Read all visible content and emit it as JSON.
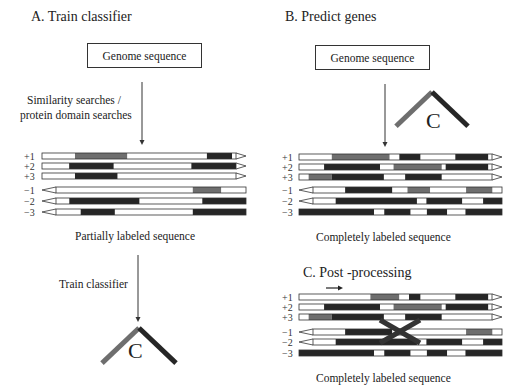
{
  "panels": {
    "a": {
      "title": "A. Train classifier",
      "input_box": "Genome sequence",
      "step_label_line1": "Similarity searches /",
      "step_label_line2": "protein domain searches",
      "caption": "Partially labeled sequence",
      "train_label": "Train classifier",
      "classifier_letter": "C"
    },
    "b": {
      "title": "B. Predict genes",
      "input_box": "Genome sequence",
      "classifier_letter": "C",
      "caption": "Completely labeled sequence"
    },
    "c": {
      "title": "C. Post -processing",
      "caption": "Completely labeled sequence"
    }
  },
  "frame_labels": [
    "+1",
    "+2",
    "+3",
    "−1",
    "−2",
    "−3"
  ],
  "colors": {
    "coding_dark": "#262626",
    "coding_gray": "#6e6e6e",
    "noncoding": "#ffffff",
    "outline": "#333333"
  },
  "tracks": {
    "a": [
      {
        "label": "+1",
        "dir": "fwd",
        "segs": [
          [
            0,
            0.17,
            "w"
          ],
          [
            0.17,
            0.44,
            "g"
          ],
          [
            0.44,
            0.85,
            "w"
          ],
          [
            0.85,
            0.98,
            "d"
          ],
          [
            0.98,
            1,
            "w"
          ]
        ]
      },
      {
        "label": "+2",
        "dir": "fwd",
        "segs": [
          [
            0,
            0.14,
            "w"
          ],
          [
            0.14,
            0.37,
            "d"
          ],
          [
            0.37,
            0.77,
            "w"
          ],
          [
            0.77,
            1,
            "d"
          ]
        ]
      },
      {
        "label": "+3",
        "dir": "fwd",
        "segs": [
          [
            0,
            0.17,
            "w"
          ],
          [
            0.17,
            0.39,
            "d"
          ],
          [
            0.39,
            1,
            "w"
          ]
        ]
      },
      {
        "label": "−1",
        "dir": "rev",
        "segs": [
          [
            0,
            0.2,
            "w"
          ],
          [
            0.2,
            0.72,
            "w"
          ],
          [
            0.72,
            0.87,
            "g"
          ],
          [
            0.87,
            1,
            "w"
          ]
        ]
      },
      {
        "label": "−2",
        "dir": "rev",
        "segs": [
          [
            0,
            0.07,
            "w"
          ],
          [
            0.07,
            0.44,
            "d"
          ],
          [
            0.44,
            0.77,
            "w"
          ],
          [
            0.77,
            1,
            "d"
          ]
        ]
      },
      {
        "label": "−3",
        "dir": "rev",
        "segs": [
          [
            0,
            0.13,
            "w"
          ],
          [
            0.13,
            0.31,
            "d"
          ],
          [
            0.31,
            0.72,
            "w"
          ],
          [
            0.72,
            1,
            "d"
          ]
        ]
      }
    ],
    "b": [
      {
        "label": "+1",
        "dir": "fwd",
        "segs": [
          [
            0,
            0.17,
            "w"
          ],
          [
            0.17,
            0.47,
            "g"
          ],
          [
            0.47,
            0.52,
            "w"
          ],
          [
            0.52,
            0.63,
            "d"
          ],
          [
            0.63,
            0.81,
            "w"
          ],
          [
            0.81,
            0.98,
            "d"
          ]
        ]
      },
      {
        "label": "+2",
        "dir": "fwd",
        "segs": [
          [
            0,
            0.13,
            "w"
          ],
          [
            0.13,
            0.42,
            "d"
          ],
          [
            0.42,
            0.49,
            "w"
          ],
          [
            0.49,
            0.74,
            "g"
          ],
          [
            0.74,
            0.76,
            "w"
          ],
          [
            0.76,
            0.98,
            "d"
          ]
        ]
      },
      {
        "label": "+3",
        "dir": "fwd",
        "segs": [
          [
            0,
            0.05,
            "w"
          ],
          [
            0.05,
            0.17,
            "g"
          ],
          [
            0.17,
            0.44,
            "d"
          ],
          [
            0.44,
            0.55,
            "w"
          ],
          [
            0.55,
            0.74,
            "d"
          ],
          [
            0.74,
            0.98,
            "w"
          ]
        ]
      },
      {
        "label": "−1",
        "dir": "rev",
        "segs": [
          [
            0,
            0.17,
            "w"
          ],
          [
            0.17,
            0.42,
            "d"
          ],
          [
            0.42,
            0.5,
            "w"
          ],
          [
            0.5,
            0.62,
            "g"
          ],
          [
            0.62,
            0.81,
            "w"
          ],
          [
            0.81,
            0.95,
            "g"
          ],
          [
            0.95,
            1,
            "w"
          ]
        ]
      },
      {
        "label": "−2",
        "dir": "rev",
        "segs": [
          [
            0,
            0.12,
            "w"
          ],
          [
            0.12,
            0.55,
            "d"
          ],
          [
            0.55,
            0.6,
            "w"
          ],
          [
            0.6,
            0.79,
            "d"
          ],
          [
            0.79,
            0.9,
            "w"
          ],
          [
            0.9,
            1,
            "d"
          ]
        ]
      },
      {
        "label": "−3",
        "dir": "none",
        "segs": [
          [
            0,
            0.37,
            "d"
          ],
          [
            0.37,
            0.42,
            "w"
          ],
          [
            0.42,
            0.55,
            "d"
          ],
          [
            0.55,
            0.63,
            "w"
          ],
          [
            0.63,
            0.73,
            "d"
          ],
          [
            0.73,
            0.82,
            "w"
          ],
          [
            0.82,
            1,
            "d"
          ]
        ]
      }
    ],
    "c": [
      {
        "label": "+1",
        "dir": "fwd",
        "segs": [
          [
            0,
            0.37,
            "w"
          ],
          [
            0.37,
            0.52,
            "g"
          ],
          [
            0.52,
            0.57,
            "w"
          ],
          [
            0.57,
            0.63,
            "d"
          ],
          [
            0.63,
            0.81,
            "w"
          ],
          [
            0.81,
            0.98,
            "d"
          ]
        ]
      },
      {
        "label": "+2",
        "dir": "fwd",
        "segs": [
          [
            0,
            0.13,
            "w"
          ],
          [
            0.13,
            0.42,
            "d"
          ],
          [
            0.42,
            0.49,
            "w"
          ],
          [
            0.49,
            0.74,
            "g"
          ],
          [
            0.74,
            0.76,
            "w"
          ],
          [
            0.76,
            0.98,
            "d"
          ]
        ]
      },
      {
        "label": "+3",
        "dir": "fwd",
        "segs": [
          [
            0,
            0.05,
            "w"
          ],
          [
            0.05,
            0.17,
            "g"
          ],
          [
            0.17,
            0.44,
            "d"
          ],
          [
            0.44,
            0.55,
            "w"
          ],
          [
            0.55,
            0.74,
            "d"
          ],
          [
            0.74,
            0.98,
            "w"
          ]
        ]
      },
      {
        "label": "−1",
        "dir": "rev",
        "segs": [
          [
            0,
            0.17,
            "w"
          ],
          [
            0.17,
            0.42,
            "d"
          ],
          [
            0.42,
            0.5,
            "w"
          ],
          [
            0.5,
            0.62,
            "w"
          ],
          [
            0.62,
            0.81,
            "w"
          ],
          [
            0.81,
            0.95,
            "g"
          ],
          [
            0.95,
            1,
            "w"
          ]
        ]
      },
      {
        "label": "−2",
        "dir": "rev",
        "segs": [
          [
            0,
            0.12,
            "w"
          ],
          [
            0.12,
            0.55,
            "d"
          ],
          [
            0.55,
            0.6,
            "w"
          ],
          [
            0.6,
            0.79,
            "d"
          ],
          [
            0.79,
            0.9,
            "w"
          ],
          [
            0.9,
            1,
            "d"
          ]
        ]
      },
      {
        "label": "−3",
        "dir": "none",
        "segs": [
          [
            0,
            0.37,
            "d"
          ],
          [
            0.37,
            0.42,
            "w"
          ],
          [
            0.42,
            0.55,
            "d"
          ],
          [
            0.55,
            0.63,
            "w"
          ],
          [
            0.63,
            0.73,
            "d"
          ],
          [
            0.73,
            0.82,
            "w"
          ],
          [
            0.82,
            1,
            "d"
          ]
        ]
      }
    ]
  }
}
